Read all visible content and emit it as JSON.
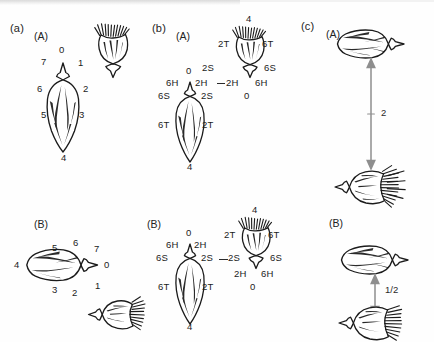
{
  "figure": {
    "background_color": "#fefefe",
    "ink_color": "#1b1b1b",
    "arrow_color": "#8e8e8e",
    "panels": [
      {
        "id": "a",
        "label": "(a)",
        "subpanels": [
          {
            "id": "a-A",
            "label": "(A)",
            "orientation": "vertical",
            "labels": [
              "0",
              "1",
              "2",
              "3",
              "4",
              "5",
              "6",
              "7"
            ],
            "label_scheme": "clock-numeric-8"
          },
          {
            "id": "a-B",
            "label": "(B)",
            "orientation": "horizontal",
            "labels": [
              "0",
              "1",
              "2",
              "3",
              "4",
              "5",
              "6",
              "7"
            ],
            "label_scheme": "clock-numeric-8"
          }
        ]
      },
      {
        "id": "b",
        "label": "(b)",
        "subpanels": [
          {
            "id": "b-A",
            "label": "(A)",
            "orientation": "diagonal",
            "left_bud_labels": [
              "0",
              "6H",
              "2H",
              "6S",
              "2S",
              "6T",
              "2T",
              "4"
            ],
            "right_bud_labels": [
              "4",
              "2T",
              "6T",
              "2S",
              "6S",
              "2H",
              "6H",
              "0"
            ],
            "contact_left": "2H",
            "contact_right": "2H",
            "contact_link": "--"
          },
          {
            "id": "b-B",
            "label": "(B)",
            "orientation": "diagonal",
            "left_bud_labels": [
              "0",
              "6H",
              "2H",
              "6S",
              "2S",
              "6T",
              "2T",
              "4"
            ],
            "right_bud_labels": [
              "4",
              "2T",
              "6T",
              "2S",
              "6S",
              "2H",
              "6H",
              "0"
            ],
            "contact_left": "2S",
            "contact_right": "2S",
            "contact_link": "--"
          }
        ]
      },
      {
        "id": "c",
        "label": "(c)",
        "subpanels": [
          {
            "id": "c-A",
            "label": "(A)",
            "orientation": "vertical-stack",
            "arrow_label": "2",
            "arrow_type": "double-headed-vertical",
            "arrow_length": "long"
          },
          {
            "id": "c-B",
            "label": "(B)",
            "orientation": "vertical-stack",
            "arrow_label": "1/2",
            "arrow_type": "double-headed-vertical",
            "arrow_length": "short"
          }
        ]
      }
    ]
  },
  "panel_a": {
    "label": "(a)",
    "A": {
      "label": "(A)",
      "tags": {
        "t0": "0",
        "t1": "1",
        "t2": "2",
        "t3": "3",
        "t4": "4",
        "t5": "5",
        "t6": "6",
        "t7": "7"
      }
    },
    "B": {
      "label": "(B)",
      "tags": {
        "t0": "0",
        "t1": "1",
        "t2": "2",
        "t3": "3",
        "t4": "4",
        "t5": "5",
        "t6": "6",
        "t7": "7"
      }
    }
  },
  "panel_b": {
    "label": "(b)",
    "A": {
      "label": "(A)",
      "left": {
        "top": "0",
        "up_left": "6H",
        "up_right": "2H",
        "mid_left": "6S",
        "mid_right": "2S",
        "low_left": "6T",
        "low_right": "2T",
        "bottom": "4"
      },
      "right": {
        "top": "4",
        "up_left": "2T",
        "up_right": "6T",
        "mid_left": "2S",
        "mid_right": "6S",
        "low_left": "2H",
        "low_right": "6H",
        "bottom": "0"
      },
      "bridge_left": "2H",
      "bridge_right": "2H"
    },
    "B": {
      "label": "(B)",
      "left": {
        "top": "0",
        "up_left": "6H",
        "up_right": "2H",
        "mid_left": "6S",
        "mid_right": "2S",
        "low_left": "6T",
        "low_right": "2T",
        "bottom": "4"
      },
      "right": {
        "top": "4",
        "up_left": "2T",
        "up_right": "6T",
        "mid_left": "2S",
        "mid_right": "6S",
        "low_left": "2H",
        "low_right": "6H",
        "bottom": "0"
      },
      "bridge_left": "2S",
      "bridge_right": "2S"
    }
  },
  "panel_c": {
    "label": "(c)",
    "A": {
      "label": "(A)",
      "arrow_value": "2"
    },
    "B": {
      "label": "(B)",
      "arrow_value": "1/2"
    }
  }
}
